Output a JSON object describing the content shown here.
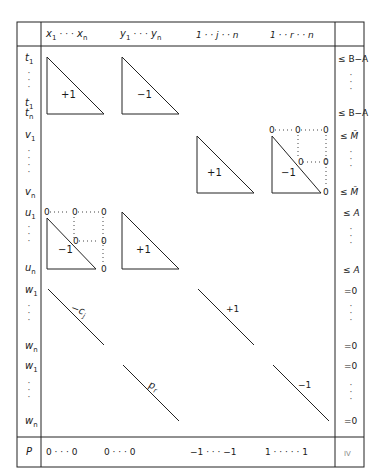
{
  "header": {
    "col_x": {
      "first": "x",
      "first_sub": "1",
      "dots": "· · ·",
      "last": "x",
      "last_sub": "n"
    },
    "col_y": {
      "first": "y",
      "first_sub": "1",
      "dots": "· · ·",
      "last": "y",
      "last_sub": "n"
    },
    "col_j": "1 · · j · · n",
    "col_r": "1 · · r · · n"
  },
  "rows": {
    "t": {
      "first": "t",
      "first_sub": "1",
      "last_a": "t",
      "last_a_sub": "1",
      "last_b": "t",
      "last_b_sub": "n"
    },
    "v": {
      "first": "v",
      "first_sub": "1",
      "last": "v",
      "last_sub": "n"
    },
    "u": {
      "first": "u",
      "first_sub": "1",
      "last": "u",
      "last_sub": "n"
    },
    "w_a": {
      "first": "w",
      "first_sub": "1",
      "last": "w",
      "last_sub": "n"
    },
    "w_b": {
      "first": "w",
      "first_sub": "1",
      "last": "w",
      "last_sub": "n"
    },
    "p": {
      "label": "P"
    }
  },
  "blocks": {
    "t_x": "+1",
    "t_y": "−1",
    "v_j": "+1",
    "v_r": "−1",
    "u_x": "−1",
    "u_y": "+1",
    "w_a_x": "−c",
    "w_a_x_sub": "j",
    "w_a_j": "+1",
    "w_b_y": "p",
    "w_b_y_sub": "r",
    "w_b_r": "−1",
    "zero": "0"
  },
  "constraints": {
    "t_first": "≤ B−A",
    "t_last": "≤ B−A",
    "v_first": "≤ M̄",
    "v_last": "≤ M̄",
    "u_first": "≤ A",
    "u_last": "≤ A",
    "w_a_first": "=0",
    "w_a_last": "=0",
    "w_b_first": "=0",
    "w_b_last": "=0",
    "p": "IV"
  },
  "objective_row": {
    "x_part": "0  · · ·  0",
    "y_part": "0 · · ·     0",
    "j_part": "−1   · · ·   −1",
    "r_part": "1  · · · · ·  1"
  },
  "colors": {
    "line": "#222222",
    "background": "#ffffff"
  }
}
